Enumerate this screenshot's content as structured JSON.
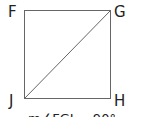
{
  "diagram": {
    "type": "square-with-diagonal",
    "vertices": [
      {
        "label": "F",
        "position": "top-left"
      },
      {
        "label": "G",
        "position": "top-right"
      },
      {
        "label": "H",
        "position": "bottom-right"
      },
      {
        "label": "J",
        "position": "bottom-left"
      }
    ],
    "diagonal": {
      "from": "J",
      "to": "G"
    },
    "caption": "m∠FGJ = 90°",
    "colors": {
      "stroke": "#555555",
      "text": "#222222"
    }
  }
}
